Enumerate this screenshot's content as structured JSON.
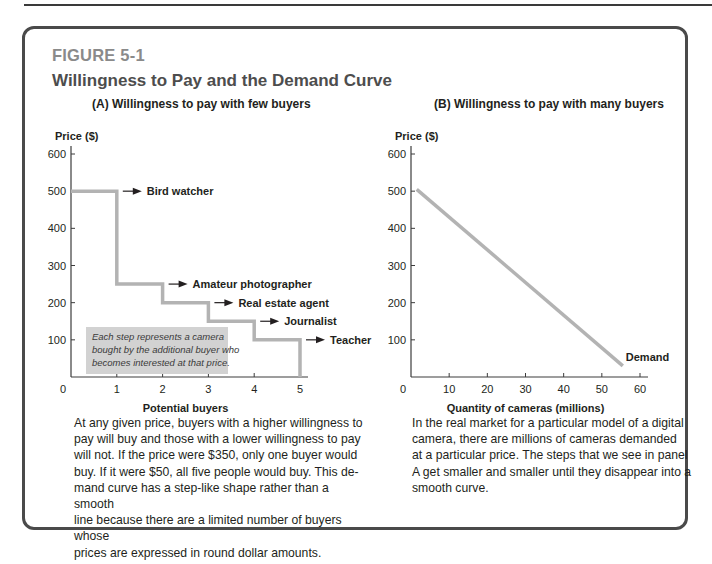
{
  "figure": {
    "label": "FIGURE 5-1",
    "title": "Willingness to Pay and the Demand Curve"
  },
  "colors": {
    "frame": "#4a4a4a",
    "figure_label": "#8a8a8a",
    "title": "#4d4d4d",
    "curve": "#b3b3b3",
    "axis": "#3c3c3c",
    "note_box": "#d2d2d2"
  },
  "panel_a": {
    "title": "(A) Willingness to pay with few buyers",
    "ylabel": "Price ($)",
    "xlabel": "Potential buyers",
    "note": "Each step represents a camera bought by the additional buyer who becomes interested at that price.",
    "note_lines": [
      "Each step represents a camera",
      "bought by the additional buyer who",
      "becomes interested at that price."
    ],
    "caption": "At any given price, buyers with a higher willingness to pay will buy and those with a lower willingness to pay will not. If the price were $350, only one buyer would buy. If it were $50, all five people would buy. This demand curve has a step-like shape rather than a smooth line because there are a limited number of buyers whose prices are expressed in round dollar amounts.",
    "caption_lines": [
      "At any given price, buyers with a higher willingness to",
      "pay will buy and those with a lower willingness to pay",
      "will not. If the price were $350, only one buyer would",
      "buy. If it were $50, all five people would buy. This de-",
      "mand curve has a step-like shape rather than a smooth",
      "line because there are a limited number of buyers whose",
      "prices are expressed in round dollar amounts."
    ]
  },
  "panel_b": {
    "title": "(B) Willingness to pay with many buyers",
    "ylabel": "Price ($)",
    "xlabel": "Quantity of cameras (millions)",
    "curve_label": "Demand",
    "caption": "In the real market for a particular model of a digital camera, there are millions of cameras demanded at a particular price. The steps that we see in panel A get smaller and smaller until they disappear into a smooth curve.",
    "caption_lines": [
      "In the real market for a particular model of a digital",
      "camera, there are millions of cameras demanded",
      "at a particular price. The steps that we see in panel",
      "A get smaller and smaller until they disappear into a",
      "smooth curve."
    ]
  },
  "chart_data": [
    {
      "type": "line",
      "subtype": "step",
      "title": "(A) Willingness to pay with few buyers",
      "xlabel": "Potential buyers",
      "ylabel": "Price ($)",
      "xlim": [
        0,
        5
      ],
      "ylim": [
        0,
        600
      ],
      "x_ticks": [
        0,
        1,
        2,
        3,
        4,
        5
      ],
      "y_ticks": [
        100,
        200,
        300,
        400,
        500,
        600
      ],
      "grid": false,
      "steps": [
        {
          "buyer": "Bird watcher",
          "x_from": 0,
          "x_to": 1,
          "price": 500
        },
        {
          "buyer": "Amateur photographer",
          "x_from": 1,
          "x_to": 2,
          "price": 250
        },
        {
          "buyer": "Real estate agent",
          "x_from": 2,
          "x_to": 3,
          "price": 200
        },
        {
          "buyer": "Journalist",
          "x_from": 3,
          "x_to": 4,
          "price": 150
        },
        {
          "buyer": "Teacher",
          "x_from": 4,
          "x_to": 5,
          "price": 100
        }
      ],
      "annotations": [
        "Bird watcher",
        "Amateur photographer",
        "Real estate agent",
        "Journalist",
        "Teacher",
        "Each step represents a camera bought by the additional buyer who becomes interested at that price."
      ]
    },
    {
      "type": "line",
      "title": "(B) Willingness to pay with many buyers",
      "xlabel": "Quantity of cameras (millions)",
      "ylabel": "Price ($)",
      "xlim": [
        0,
        60
      ],
      "ylim": [
        0,
        600
      ],
      "x_ticks": [
        0,
        10,
        20,
        30,
        40,
        50,
        60
      ],
      "y_ticks": [
        100,
        200,
        300,
        400,
        500,
        600
      ],
      "grid": false,
      "series": [
        {
          "name": "Demand",
          "x": [
            1.5,
            55.5
          ],
          "y": [
            505,
            30
          ]
        }
      ],
      "annotations": [
        "Demand"
      ]
    }
  ]
}
